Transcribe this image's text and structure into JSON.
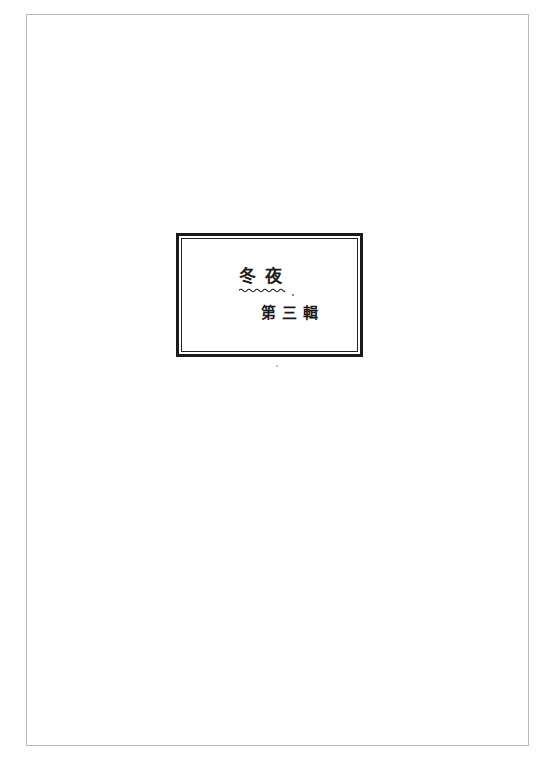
{
  "document": {
    "title": "冬夜",
    "subtitle": "第三輯"
  },
  "colors": {
    "ink": "#1a1a1a",
    "page_border": "#b8b8b8",
    "background": "#ffffff"
  }
}
